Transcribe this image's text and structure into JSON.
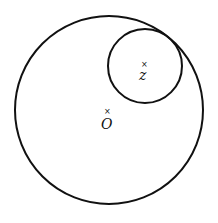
{
  "diagram": {
    "large_circle": {
      "cx": 109,
      "cy": 110,
      "r": 94
    },
    "small_circle": {
      "cx": 145,
      "cy": 66,
      "r": 37
    },
    "points": [
      {
        "label": "z",
        "marker": "×"
      },
      {
        "label": "O",
        "marker": "×"
      }
    ]
  }
}
